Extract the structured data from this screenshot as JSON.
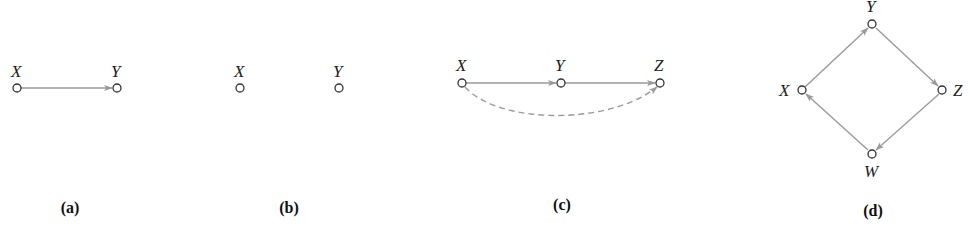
{
  "panels": [
    {
      "id": "a",
      "caption": "(a)",
      "nodes": [
        {
          "label": "X",
          "x": 17,
          "y": 88
        },
        {
          "label": "Y",
          "x": 117,
          "y": 88
        }
      ],
      "edges": [
        {
          "from": "X",
          "to": "Y",
          "style": "solid"
        }
      ]
    },
    {
      "id": "b",
      "caption": "(b)",
      "nodes": [
        {
          "label": "X",
          "x": 240,
          "y": 88
        },
        {
          "label": "Y",
          "x": 339,
          "y": 88
        }
      ],
      "edges": []
    },
    {
      "id": "c",
      "caption": "(c)",
      "nodes": [
        {
          "label": "X",
          "x": 462,
          "y": 83
        },
        {
          "label": "Y",
          "x": 561,
          "y": 83
        },
        {
          "label": "Z",
          "x": 660,
          "y": 83
        }
      ],
      "edges": [
        {
          "from": "X",
          "to": "Y",
          "style": "solid"
        },
        {
          "from": "Y",
          "to": "Z",
          "style": "solid"
        },
        {
          "from": "X",
          "to": "Z",
          "style": "dashed"
        }
      ]
    },
    {
      "id": "d",
      "caption": "(d)",
      "nodes": [
        {
          "label": "Y",
          "x": 872,
          "y": 24
        },
        {
          "label": "Z",
          "x": 942,
          "y": 90
        },
        {
          "label": "W",
          "x": 872,
          "y": 154
        },
        {
          "label": "X",
          "x": 802,
          "y": 90
        }
      ],
      "edges": [
        {
          "from": "X",
          "to": "Y",
          "style": "solid"
        },
        {
          "from": "Y",
          "to": "Z",
          "style": "solid"
        },
        {
          "from": "Z",
          "to": "W",
          "style": "solid"
        },
        {
          "from": "W",
          "to": "X",
          "style": "solid"
        }
      ]
    }
  ],
  "colors": {
    "edge": "#9a9a9a",
    "node_stroke": "#333333",
    "text": "#222222"
  }
}
